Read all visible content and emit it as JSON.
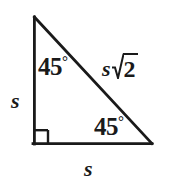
{
  "figure": {
    "kind": "geometry-diagram",
    "width": 169,
    "height": 179,
    "background_color": "#ffffff",
    "stroke_color": "#1a1a1a",
    "stroke_width": 2.6,
    "vertices": {
      "apex": {
        "x": 34,
        "y": 17
      },
      "right_angle": {
        "x": 34,
        "y": 144
      },
      "bottom_right": {
        "x": 152,
        "y": 144
      }
    },
    "right_angle_marker": {
      "present": true,
      "size": 14,
      "x": 34,
      "y": 130
    },
    "labels": {
      "angle_top": "45",
      "angle_top_degree": "°",
      "angle_bottom_right": "45",
      "angle_bottom_right_degree": "°",
      "leg_left": "s",
      "leg_bottom": "s",
      "hypotenuse_coefficient": "s",
      "hypotenuse_radicand": "2"
    }
  }
}
